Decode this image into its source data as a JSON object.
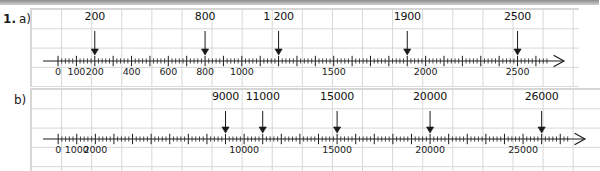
{
  "exercise": {
    "number": "1.",
    "parts": [
      {
        "letter": "a)"
      },
      {
        "letter": "b)"
      }
    ]
  },
  "colors": {
    "grid_line": "#d6d6d6",
    "axis": "#1c1c1c",
    "text": "#111111",
    "top_strip": "#9a9a9a"
  },
  "chart_data": {
    "type": "number-line",
    "title": "",
    "lines": [
      {
        "id": "a",
        "label": "a)",
        "xlim": [
          -60,
          2780
        ],
        "minor_tick_step": 20,
        "major_tick_step": 100,
        "labeled_tick_step": 200,
        "axis_tick_labels": [
          {
            "value": 0,
            "text": "0"
          },
          {
            "value": 100,
            "text": "100"
          },
          {
            "value": 200,
            "text": "200"
          },
          {
            "value": 400,
            "text": "400"
          },
          {
            "value": 600,
            "text": "600"
          },
          {
            "value": 800,
            "text": "800"
          },
          {
            "value": 1000,
            "text": "1000"
          },
          {
            "value": 1500,
            "text": "1500"
          },
          {
            "value": 2000,
            "text": "2000"
          },
          {
            "value": 2500,
            "text": "2500"
          }
        ],
        "arrow_markers": [
          {
            "value": 200,
            "text": "200"
          },
          {
            "value": 800,
            "text": "800"
          },
          {
            "value": 1200,
            "text": "1 200"
          },
          {
            "value": 1900,
            "text": "1900"
          },
          {
            "value": 2500,
            "text": "2500"
          }
        ]
      },
      {
        "id": "b",
        "label": "b)",
        "xlim": [
          -600,
          28600
        ],
        "minor_tick_step": 200,
        "major_tick_step": 1000,
        "labeled_tick_step": 5000,
        "axis_tick_labels": [
          {
            "value": 0,
            "text": "0"
          },
          {
            "value": 1000,
            "text": "1000"
          },
          {
            "value": 2000,
            "text": "2000"
          },
          {
            "value": 10000,
            "text": "10000"
          },
          {
            "value": 15000,
            "text": "15000"
          },
          {
            "value": 20000,
            "text": "20000"
          },
          {
            "value": 25000,
            "text": "25000"
          }
        ],
        "arrow_markers": [
          {
            "value": 9000,
            "text": "9000"
          },
          {
            "value": 11000,
            "text": "11000"
          },
          {
            "value": 15000,
            "text": "15000"
          },
          {
            "value": 20000,
            "text": "20000"
          },
          {
            "value": 26000,
            "text": "26000"
          }
        ]
      }
    ]
  }
}
